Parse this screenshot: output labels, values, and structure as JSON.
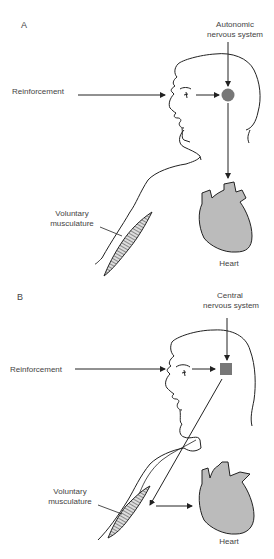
{
  "panels": [
    {
      "letter": "A",
      "system_label_line1": "Autonomic",
      "system_label_line2": "nervous system",
      "system_marker": "circle",
      "input_label": "Reinforcement",
      "muscle_label_line1": "Voluntary",
      "muscle_label_line2": "musculature",
      "organ_label": "Heart",
      "pathway": "nervous system to heart"
    },
    {
      "letter": "B",
      "system_label_line1": "Central",
      "system_label_line2": "nervous system",
      "system_marker": "square",
      "input_label": "Reinforcement",
      "muscle_label_line1": "Voluntary",
      "muscle_label_line2": "musculature",
      "organ_label": "Heart",
      "pathway": "nervous system to muscle to heart"
    }
  ],
  "colors": {
    "line": "#222222",
    "marker_fill": "#777777",
    "heart_fill": "#bbbbbb",
    "text": "#444444"
  }
}
